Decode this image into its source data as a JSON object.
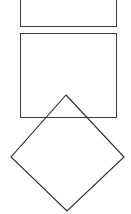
{
  "figure": {
    "width": 131,
    "height": 214,
    "background_color": "#ffffff",
    "stroke_color": "#3a3a3a",
    "stroke_color_dark": "#2b2b2b",
    "stroke_width": 1,
    "shape_count": 3,
    "shapes": [
      {
        "id": "rectangle-top",
        "name": "top rectangle",
        "type": "rectangle",
        "clipped": "top edge cropped by image border",
        "x": 20,
        "y": -6,
        "width": 96,
        "height": 32,
        "stroke": "#3a3a3a",
        "fill": "none"
      },
      {
        "id": "rectangle-main",
        "name": "large rectangle",
        "type": "rectangle",
        "clipped": "none",
        "x": 20,
        "y": 33,
        "width": 96,
        "height": 84,
        "stroke": "#3a3a3a",
        "fill": "none"
      },
      {
        "id": "diamond",
        "name": "rotated square (diamond)",
        "type": "polygon",
        "clipped": "none",
        "points": "66,95 124,157 67,211 11,157",
        "vertices": {
          "top": [
            66,
            95
          ],
          "right": [
            124,
            157
          ],
          "bottom": [
            67,
            211
          ],
          "left": [
            11,
            157
          ]
        },
        "stroke": "#2b2b2b",
        "fill": "none"
      }
    ]
  }
}
